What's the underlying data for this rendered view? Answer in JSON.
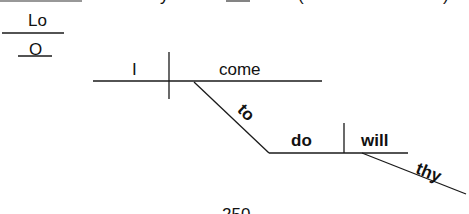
{
  "diagram": {
    "type": "sentence-diagram",
    "top_fragments": [
      "Lord",
      "y",
      "_",
      "(",
      ")"
    ],
    "interjection": {
      "word": "Lo"
    },
    "interjection2": {
      "word": "O"
    },
    "main_clause": {
      "subject": "I",
      "verb": "come",
      "infinitive_connector": "to",
      "infinitive_verb": "do",
      "object": "will",
      "object_modifier": "thy"
    },
    "page_number": "250"
  },
  "colors": {
    "line": "#1a1a1a",
    "text": "#111111",
    "background": "#ffffff"
  }
}
